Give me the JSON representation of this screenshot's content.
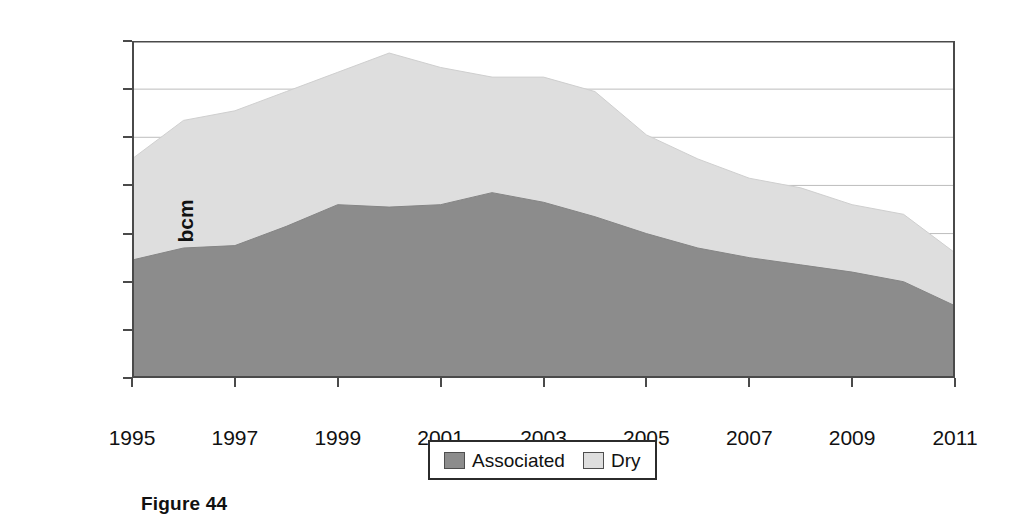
{
  "figure": {
    "caption": "Figure 44"
  },
  "legend": {
    "position": "bottom-center",
    "entries": [
      {
        "label": "Associated",
        "color": "#8c8c8c",
        "swatch_name": "legend-swatch-associated"
      },
      {
        "label": "Dry",
        "color": "#dedede",
        "swatch_name": "legend-swatch-dry"
      }
    ]
  },
  "chart_data": {
    "type": "area",
    "stacked": true,
    "title": "",
    "subtitle": "",
    "xlabel": "",
    "ylabel": "bcm",
    "xlim": [
      1995,
      2011
    ],
    "ylim": [
      0,
      140
    ],
    "grid": true,
    "grid_axis": "y",
    "x": [
      1995,
      1996,
      1997,
      1998,
      1999,
      2000,
      2001,
      2002,
      2003,
      2004,
      2005,
      2006,
      2007,
      2008,
      2009,
      2010,
      2011
    ],
    "xticks": [
      1995,
      1997,
      1999,
      2001,
      2003,
      2005,
      2007,
      2009,
      2011
    ],
    "xtick_labels": [
      "1995",
      "1997",
      "1999",
      "2001",
      "2003",
      "2005",
      "2007",
      "2009",
      "2011"
    ],
    "yticks": [
      0,
      20,
      40,
      60,
      80,
      100,
      120,
      140
    ],
    "ytick_labels": [
      "0",
      "20",
      "40",
      "60",
      "80",
      "100",
      "120",
      "140"
    ],
    "series": [
      {
        "name": "Associated",
        "color": "#8c8c8c",
        "values": [
          49,
          54,
          55,
          63,
          72,
          71,
          72,
          77,
          73,
          67,
          60,
          54,
          50,
          47,
          44,
          40,
          30
        ]
      },
      {
        "name": "Dry",
        "color": "#dedede",
        "values": [
          42,
          53,
          56,
          56,
          55,
          64,
          57,
          48,
          52,
          52,
          41,
          37,
          33,
          32,
          28,
          28,
          22
        ]
      }
    ],
    "totals": [
      91,
      107,
      111,
      119,
      127,
      135,
      129,
      125,
      125,
      119,
      101,
      91,
      83,
      79,
      72,
      68,
      52
    ]
  }
}
